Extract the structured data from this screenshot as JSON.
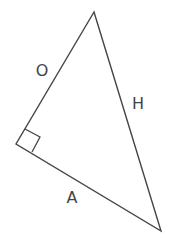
{
  "diagram": {
    "type": "right-triangle",
    "colors": {
      "stroke": "#444444",
      "background": "#ffffff",
      "label": "#444444"
    },
    "vertices": {
      "top": [
        94,
        12
      ],
      "right_angle": [
        16,
        144
      ],
      "bottom_right": [
        161,
        231
      ]
    },
    "right_angle_marker": [
      [
        25,
        129
      ],
      [
        40,
        137
      ],
      [
        32,
        152
      ]
    ],
    "labels": {
      "opposite": {
        "text": "O",
        "x": 42,
        "y": 76
      },
      "hypotenuse": {
        "text": "H",
        "x": 138,
        "y": 109
      },
      "adjacent": {
        "text": "A",
        "x": 72,
        "y": 203
      }
    }
  }
}
